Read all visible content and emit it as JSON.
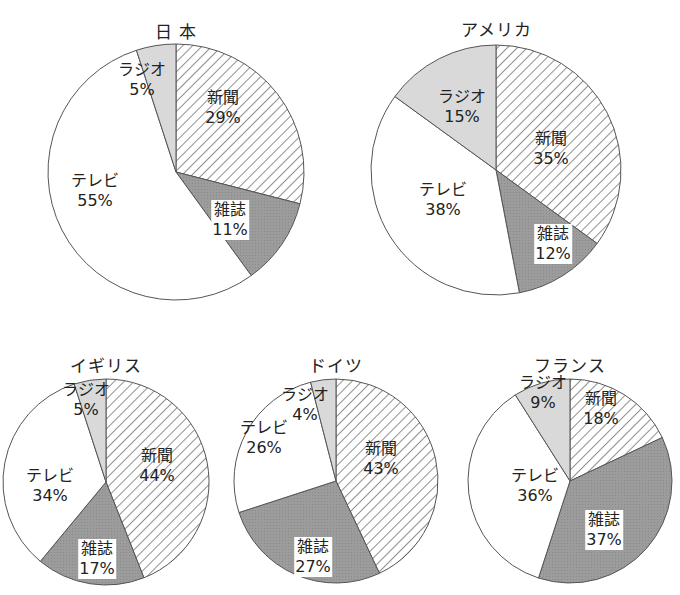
{
  "colors": {
    "newspaper_hatch_line": "#333333",
    "newspaper_bg": "#ffffff",
    "magazine": "#9c9c9c",
    "television": "#ffffff",
    "radio": "#d9d9d9",
    "outline": "#555555"
  },
  "chart_data": [
    {
      "type": "pie",
      "title": "日 本",
      "categories": [
        "新聞",
        "雑誌",
        "テレビ",
        "ラジオ"
      ],
      "values": [
        29,
        11,
        55,
        5
      ],
      "labels": [
        "29%",
        "11%",
        "55%",
        "5%"
      ],
      "start_angle": "12 o'clock",
      "direction": "clockwise",
      "center": [
        176,
        172
      ],
      "radius": 128,
      "title_pos": [
        176,
        18
      ]
    },
    {
      "type": "pie",
      "title": "アメリカ",
      "categories": [
        "新聞",
        "雑誌",
        "テレビ",
        "ラジオ"
      ],
      "values": [
        35,
        12,
        38,
        15
      ],
      "labels": [
        "35%",
        "12%",
        "38%",
        "15%"
      ],
      "start_angle": "12 o'clock",
      "direction": "clockwise",
      "center": [
        496,
        170
      ],
      "radius": 125,
      "title_pos": [
        496,
        16
      ]
    },
    {
      "type": "pie",
      "title": "イギリス",
      "categories": [
        "新聞",
        "雑誌",
        "テレビ",
        "ラジオ"
      ],
      "values": [
        44,
        17,
        34,
        5
      ],
      "labels": [
        "44%",
        "17%",
        "34%",
        "5%"
      ],
      "start_angle": "12 o'clock",
      "direction": "clockwise",
      "center": [
        106,
        482
      ],
      "radius": 103,
      "title_pos": [
        106,
        352
      ]
    },
    {
      "type": "pie",
      "title": "ドイツ",
      "categories": [
        "新聞",
        "雑誌",
        "テレビ",
        "ラジオ"
      ],
      "values": [
        43,
        27,
        26,
        4
      ],
      "labels": [
        "43%",
        "27%",
        "26%",
        "4%"
      ],
      "start_angle": "12 o'clock",
      "direction": "clockwise",
      "center": [
        336,
        481
      ],
      "radius": 102,
      "title_pos": [
        336,
        352
      ]
    },
    {
      "type": "pie",
      "title": "フランス",
      "categories": [
        "新聞",
        "雑誌",
        "テレビ",
        "ラジオ"
      ],
      "values": [
        18,
        37,
        36,
        9
      ],
      "labels": [
        "18%",
        "37%",
        "36%",
        "9%"
      ],
      "start_angle": "12 o'clock",
      "direction": "clockwise",
      "center": [
        570,
        481
      ],
      "radius": 102,
      "title_pos": [
        570,
        352
      ]
    }
  ],
  "label_positions": [
    [
      [
        223,
        108
      ],
      [
        230,
        220
      ],
      [
        95,
        191
      ],
      [
        142,
        80
      ]
    ],
    [
      [
        551,
        149
      ],
      [
        553,
        244
      ],
      [
        443,
        200
      ],
      [
        462,
        107
      ]
    ],
    [
      [
        157,
        466
      ],
      [
        97,
        559
      ],
      [
        50,
        486
      ],
      [
        86,
        400
      ]
    ],
    [
      [
        381,
        459
      ],
      [
        313,
        557
      ],
      [
        264,
        438
      ],
      [
        305,
        405
      ]
    ],
    [
      [
        601,
        409
      ],
      [
        604,
        530
      ],
      [
        535,
        486
      ],
      [
        543,
        393
      ]
    ]
  ]
}
